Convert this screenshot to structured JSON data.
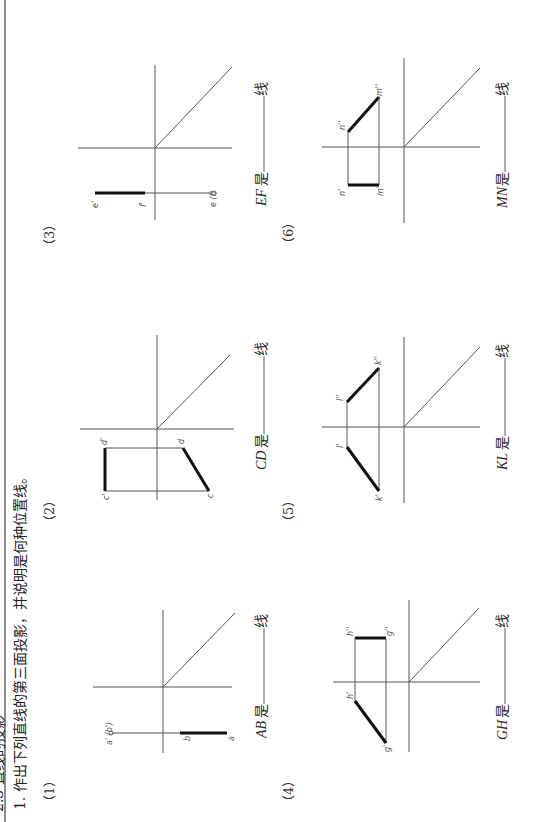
{
  "page": {
    "orientation": "rotated-90-ccw",
    "header_partial": "2.3 直线的投影",
    "instruction": "1. 作出下列直线的第三面投影，并说明是何种位置线。"
  },
  "problems": [
    {
      "number": "（1）",
      "line": "AB",
      "points": {
        "front": "a' (b')",
        "top_start": "b",
        "top_end": "a"
      },
      "answer_prefix": "AB 是",
      "answer_blank": "",
      "answer_suffix": "线"
    },
    {
      "number": "（2）",
      "line": "CD",
      "points": {
        "c_front": "c'",
        "d_front": "d'",
        "c_top": "c",
        "d_top": "d"
      },
      "answer_prefix": "CD 是",
      "answer_blank": "",
      "answer_suffix": "线"
    },
    {
      "number": "（3）",
      "line": "EF",
      "points": {
        "e_front": "e'",
        "f_front": "f'",
        "top": "e (f)"
      },
      "answer_prefix": "EF 是",
      "answer_blank": "",
      "answer_suffix": "线"
    },
    {
      "number": "（4）",
      "line": "GH",
      "points": {
        "h_side": "h''",
        "g_side": "g''",
        "h_front": "h'",
        "g_front": "g'"
      },
      "answer_prefix": "GH 是",
      "answer_blank": "",
      "answer_suffix": "线"
    },
    {
      "number": "（5）",
      "line": "KL",
      "points": {
        "l_side": "l''",
        "k_side": "k''",
        "l_front": "l'",
        "k_front": "k'"
      },
      "answer_prefix": "KL 是",
      "answer_blank": "",
      "answer_suffix": "线"
    },
    {
      "number": "（6）",
      "line": "MN",
      "points": {
        "n_side": "n''",
        "m_side": "m''",
        "n_front": "n'",
        "m_front": "m'"
      },
      "answer_prefix": "MN 是",
      "answer_blank": "",
      "answer_suffix": "线"
    }
  ]
}
